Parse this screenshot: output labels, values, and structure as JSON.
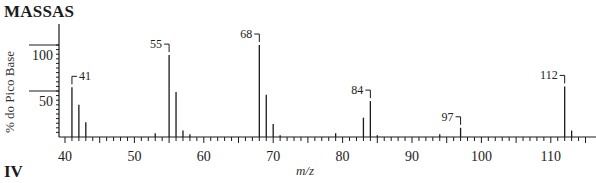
{
  "header": {
    "title": "MASSAS"
  },
  "footer": {
    "section": "IV"
  },
  "chart_data": {
    "type": "bar",
    "title": "MASSAS",
    "xlabel": "m/z",
    "ylabel": "% do Pico Base",
    "xlim": [
      39.5,
      115.5
    ],
    "ylim": [
      0,
      100
    ],
    "x_ticks": [
      40,
      50,
      60,
      70,
      80,
      90,
      100,
      110
    ],
    "y_ticks": [
      50,
      100
    ],
    "grid": false,
    "legend": null,
    "peaks": [
      {
        "mz": 41,
        "intensity": 54,
        "label": "41"
      },
      {
        "mz": 42,
        "intensity": 35
      },
      {
        "mz": 43,
        "intensity": 16
      },
      {
        "mz": 53,
        "intensity": 4
      },
      {
        "mz": 55,
        "intensity": 89,
        "label": "55"
      },
      {
        "mz": 56,
        "intensity": 49
      },
      {
        "mz": 57,
        "intensity": 7
      },
      {
        "mz": 58,
        "intensity": 3
      },
      {
        "mz": 68,
        "intensity": 100,
        "label": "68"
      },
      {
        "mz": 69,
        "intensity": 46
      },
      {
        "mz": 70,
        "intensity": 14
      },
      {
        "mz": 71,
        "intensity": 2
      },
      {
        "mz": 79,
        "intensity": 4
      },
      {
        "mz": 83,
        "intensity": 21
      },
      {
        "mz": 84,
        "intensity": 39,
        "label": "84"
      },
      {
        "mz": 85,
        "intensity": 2
      },
      {
        "mz": 94,
        "intensity": 3
      },
      {
        "mz": 97,
        "intensity": 10,
        "label": "97"
      },
      {
        "mz": 112,
        "intensity": 55,
        "label": "112"
      },
      {
        "mz": 113,
        "intensity": 7
      }
    ]
  },
  "colors": {
    "ink": "#1a1a1a",
    "background": "#ffffff"
  }
}
